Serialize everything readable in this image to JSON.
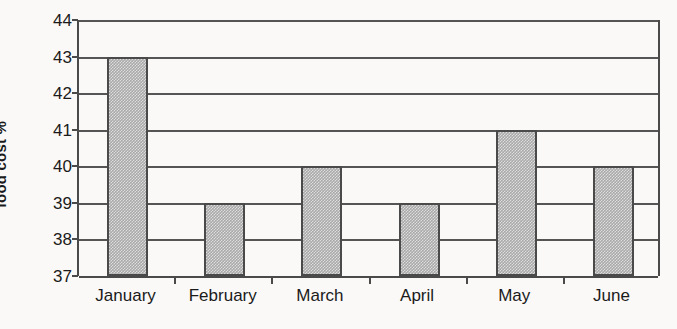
{
  "chart_data": {
    "type": "bar",
    "title": "",
    "xlabel": "",
    "ylabel": "food cost %",
    "categories": [
      "January",
      "February",
      "March",
      "April",
      "May",
      "June"
    ],
    "values": [
      43,
      39,
      40,
      39,
      41,
      40
    ],
    "series": [
      {
        "name": "food cost %",
        "values": [
          43,
          39,
          40,
          39,
          41,
          40
        ]
      }
    ],
    "ylim": [
      37,
      44
    ],
    "y_ticks": [
      37,
      38,
      39,
      40,
      41,
      42,
      43,
      44
    ],
    "y_tick_labels": [
      "37",
      "38",
      "39",
      "40",
      "41",
      "42",
      "43",
      "44"
    ],
    "grid": "horizontal",
    "legend": "none",
    "bar_fill_color": "#a9a9a9",
    "bar_border_color": "#4a4a4a",
    "axis_color": "#4a4a4a",
    "gridline_color": "#555555",
    "background_color": "#faf9f7",
    "text_color": "#1b1b1b",
    "annotations": []
  }
}
